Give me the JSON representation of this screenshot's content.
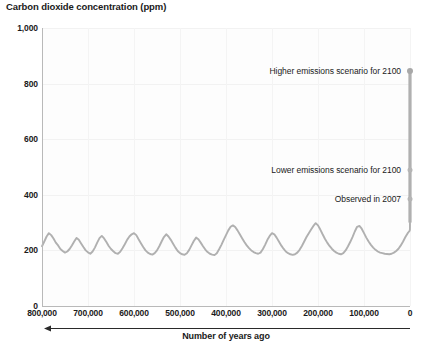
{
  "chart_data": {
    "type": "line",
    "title": "Carbon dioxide concentration (ppm)",
    "xlabel": "Number of years ago",
    "ylabel": "Carbon dioxide concentration (ppm)",
    "xlim": [
      800000,
      0
    ],
    "ylim": [
      0,
      1000
    ],
    "x_axis_inverted": true,
    "grid": true,
    "legend_position": "none",
    "y_ticks": [
      "0",
      "200",
      "400",
      "600",
      "800",
      "1,000"
    ],
    "y_tick_values": [
      0,
      200,
      400,
      600,
      800,
      1000
    ],
    "x_ticks": [
      "800,000",
      "700,000",
      "600,000",
      "500,000",
      "400,000",
      "300,000",
      "200,000",
      "100,000",
      "0"
    ],
    "x_tick_values": [
      800000,
      700000,
      600000,
      500000,
      400000,
      300000,
      200000,
      100000,
      0
    ],
    "series": [
      {
        "name": "Ice core CO2 record",
        "color": "#b0b0b0",
        "x": [
          800000,
          795000,
          790000,
          785000,
          780000,
          775000,
          770000,
          765000,
          760000,
          755000,
          750000,
          745000,
          740000,
          735000,
          730000,
          725000,
          720000,
          715000,
          710000,
          705000,
          700000,
          695000,
          690000,
          685000,
          680000,
          675000,
          670000,
          665000,
          660000,
          655000,
          650000,
          645000,
          640000,
          635000,
          630000,
          625000,
          620000,
          615000,
          610000,
          605000,
          600000,
          595000,
          590000,
          585000,
          580000,
          575000,
          570000,
          565000,
          560000,
          555000,
          550000,
          545000,
          540000,
          535000,
          530000,
          525000,
          520000,
          515000,
          510000,
          505000,
          500000,
          495000,
          490000,
          485000,
          480000,
          475000,
          470000,
          465000,
          460000,
          455000,
          450000,
          445000,
          440000,
          435000,
          430000,
          425000,
          420000,
          415000,
          410000,
          405000,
          400000,
          395000,
          390000,
          385000,
          380000,
          375000,
          370000,
          365000,
          360000,
          355000,
          350000,
          345000,
          340000,
          335000,
          330000,
          325000,
          320000,
          315000,
          310000,
          305000,
          300000,
          295000,
          290000,
          285000,
          280000,
          275000,
          270000,
          265000,
          260000,
          255000,
          250000,
          245000,
          240000,
          235000,
          230000,
          225000,
          220000,
          215000,
          210000,
          205000,
          200000,
          195000,
          190000,
          185000,
          180000,
          175000,
          170000,
          165000,
          160000,
          155000,
          150000,
          145000,
          140000,
          135000,
          130000,
          125000,
          120000,
          115000,
          110000,
          105000,
          100000,
          95000,
          90000,
          85000,
          80000,
          75000,
          70000,
          65000,
          60000,
          55000,
          50000,
          45000,
          40000,
          35000,
          30000,
          25000,
          20000,
          15000,
          10000,
          5000,
          2000,
          1000,
          500,
          200,
          100,
          50,
          0
        ],
        "y": [
          215,
          232,
          250,
          262,
          255,
          243,
          228,
          218,
          205,
          198,
          192,
          196,
          205,
          218,
          232,
          245,
          238,
          225,
          212,
          200,
          193,
          188,
          196,
          210,
          228,
          244,
          252,
          243,
          230,
          216,
          205,
          197,
          190,
          188,
          195,
          208,
          222,
          238,
          250,
          258,
          262,
          255,
          240,
          226,
          212,
          200,
          192,
          187,
          185,
          190,
          200,
          215,
          232,
          248,
          258,
          250,
          238,
          224,
          210,
          198,
          190,
          186,
          184,
          190,
          202,
          218,
          234,
          246,
          240,
          228,
          215,
          203,
          194,
          188,
          185,
          183,
          190,
          204,
          220,
          238,
          255,
          272,
          285,
          290,
          284,
          272,
          258,
          244,
          230,
          218,
          208,
          200,
          194,
          190,
          188,
          192,
          204,
          220,
          238,
          252,
          262,
          258,
          246,
          232,
          218,
          206,
          196,
          190,
          186,
          184,
          186,
          192,
          202,
          216,
          232,
          248,
          262,
          275,
          288,
          298,
          290,
          275,
          258,
          242,
          228,
          216,
          206,
          198,
          192,
          188,
          186,
          190,
          200,
          214,
          230,
          248,
          268,
          285,
          288,
          278,
          262,
          246,
          232,
          220,
          210,
          202,
          196,
          192,
          190,
          188,
          187,
          186,
          188,
          192,
          198,
          206,
          218,
          232,
          248,
          262,
          268,
          270,
          272,
          276,
          282,
          290,
          300
        ]
      }
    ],
    "annotations": [
      {
        "label": "Higher emissions scenario for 2100",
        "value": 845,
        "year_label": "2100",
        "x": 0,
        "marker": "dot-large"
      },
      {
        "label": "Lower emissions scenario for 2100",
        "value": 490,
        "year_label": "2100",
        "x": 0,
        "marker": "dot-small"
      },
      {
        "label": "Observed in 2007",
        "value": 385,
        "year_label": "2007",
        "x": 0,
        "marker": "dot-small"
      }
    ],
    "projection_bar": {
      "description": "Vertical gray bar at present day rising from observed record to higher emissions scenario",
      "color": "#b0b0b0",
      "x": 0,
      "y_from": 300,
      "y_to": 845
    },
    "axis_direction_note": "arrow points left toward older years"
  }
}
